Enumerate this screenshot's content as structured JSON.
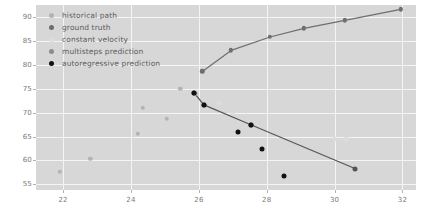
{
  "chart_data": {
    "type": "scatter",
    "title": "",
    "xlabel": "",
    "ylabel": "",
    "xlim": [
      21.2,
      32.4
    ],
    "ylim": [
      53.8,
      92.5
    ],
    "xticks": [
      22,
      24,
      26,
      28,
      30,
      32
    ],
    "yticks": [
      55,
      60,
      65,
      70,
      75,
      80,
      85,
      90
    ],
    "grid": true,
    "grid_color": "#f4f4f4",
    "plot_bg": "#d7d7d7",
    "legend_position": "upper-left",
    "series": [
      {
        "name": "historical path",
        "marker_color": "#b3b3b3",
        "line": false,
        "points": [
          {
            "x": 21.9,
            "y": 57.6
          },
          {
            "x": 22.8,
            "y": 60.3
          },
          {
            "x": 24.2,
            "y": 65.6
          },
          {
            "x": 24.35,
            "y": 71.0
          },
          {
            "x": 25.05,
            "y": 68.7
          },
          {
            "x": 25.45,
            "y": 74.9
          },
          {
            "x": 25.9,
            "y": 73.9
          }
        ]
      },
      {
        "name": "ground truth",
        "marker_color": "#6e6e6e",
        "line_color": "#6e6e6e",
        "line": true,
        "points": [
          {
            "x": 26.1,
            "y": 78.6
          },
          {
            "x": 26.95,
            "y": 83.0
          },
          {
            "x": 28.1,
            "y": 85.8
          },
          {
            "x": 29.1,
            "y": 87.6
          },
          {
            "x": 30.3,
            "y": 89.3
          },
          {
            "x": 31.95,
            "y": 91.6
          }
        ]
      },
      {
        "name": "constant velocity",
        "marker_color": "#dcdcdc",
        "line": false,
        "points": [
          {
            "x": 26.6,
            "y": 72.1
          },
          {
            "x": 27.0,
            "y": 69.7
          },
          {
            "x": 30.0,
            "y": 64.4
          },
          {
            "x": 30.35,
            "y": 64.4
          }
        ]
      },
      {
        "name": "multisteps prediction",
        "marker_color": "#555555",
        "line_color": "#555555",
        "line": true,
        "points": [
          {
            "x": 25.85,
            "y": 74.2
          },
          {
            "x": 26.15,
            "y": 71.6
          },
          {
            "x": 27.55,
            "y": 67.4
          },
          {
            "x": 30.6,
            "y": 58.3
          }
        ]
      },
      {
        "name": "autoregressive prediction",
        "marker_color": "#111111",
        "line": false,
        "points": [
          {
            "x": 25.85,
            "y": 74.2
          },
          {
            "x": 26.15,
            "y": 71.6
          },
          {
            "x": 27.15,
            "y": 65.9
          },
          {
            "x": 27.55,
            "y": 67.4
          },
          {
            "x": 27.85,
            "y": 62.3
          },
          {
            "x": 28.5,
            "y": 56.8
          }
        ]
      }
    ]
  },
  "legend": {
    "items": [
      {
        "label": "historical path",
        "color": "#b3b3b3"
      },
      {
        "label": "ground truth",
        "color": "#6e6e6e"
      },
      {
        "label": "constant velocity",
        "color": "#dcdcdc"
      },
      {
        "label": "multisteps prediction",
        "color": "#8c8c8c"
      },
      {
        "label": "autoregressive prediction",
        "color": "#111111"
      }
    ]
  }
}
